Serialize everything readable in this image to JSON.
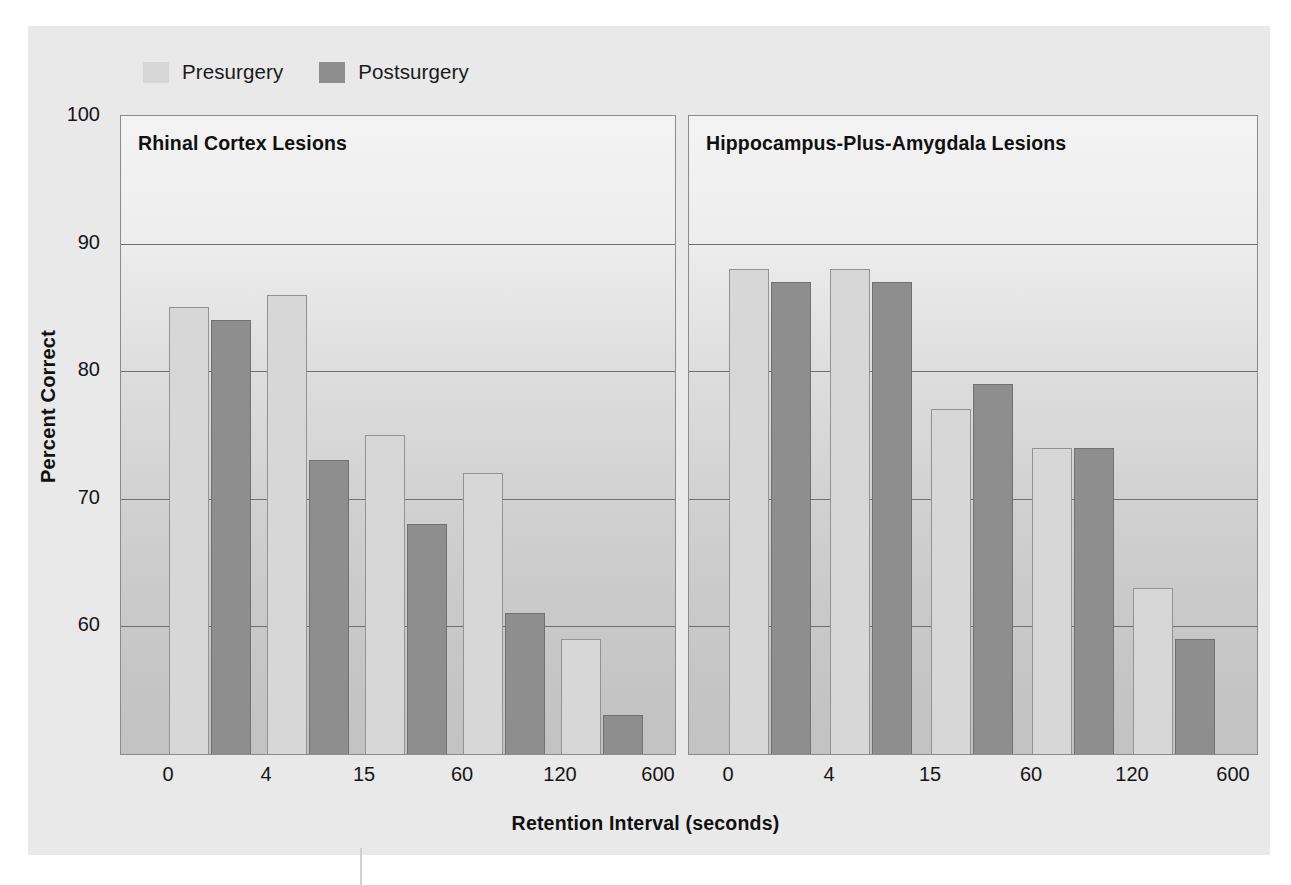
{
  "chart_data": {
    "type": "bar",
    "title": "",
    "xlabel": "Retention Interval (seconds)",
    "ylabel": "Percent Correct",
    "ylim": [
      55,
      100
    ],
    "y_ticks": [
      100,
      90,
      80,
      70,
      60
    ],
    "grid": true,
    "gridline_values": [
      90,
      80,
      70,
      60
    ],
    "legend_position": "top-left",
    "categories": [
      "0",
      "4",
      "15",
      "60",
      "120",
      "600"
    ],
    "bar_categories": [
      "4",
      "15",
      "60",
      "120",
      "600"
    ],
    "panels": [
      {
        "title": "Rhinal Cortex Lesions",
        "series": [
          {
            "name": "Presurgery",
            "values": [
              85,
              86,
              75,
              72,
              59
            ]
          },
          {
            "name": "Postsurgery",
            "values": [
              84,
              73,
              68,
              61,
              53
            ]
          }
        ]
      },
      {
        "title": "Hippocampus-Plus-Amygdala Lesions",
        "series": [
          {
            "name": "Presurgery",
            "values": [
              88,
              88,
              77,
              74,
              63
            ]
          },
          {
            "name": "Postsurgery",
            "values": [
              87,
              87,
              79,
              74,
              59
            ]
          }
        ]
      }
    ]
  },
  "legend": {
    "items": [
      {
        "label": "Presurgery",
        "color": "#d7d7d7"
      },
      {
        "label": "Postsurgery",
        "color": "#8e8e8e"
      }
    ]
  },
  "axes": {
    "y_title": "Percent Correct",
    "y_ticks": [
      "100",
      "90",
      "80",
      "70",
      "60"
    ],
    "x_title": "Retention Interval (seconds)",
    "x_ticks_left": [
      "0",
      "4",
      "15",
      "60",
      "120",
      "600"
    ],
    "x_ticks_right": [
      "0",
      "4",
      "15",
      "60",
      "120",
      "600"
    ]
  },
  "panels": {
    "left_title": "Rhinal Cortex Lesions",
    "right_title": "Hippocampus-Plus-Amygdala Lesions"
  },
  "colors": {
    "presurgery": "#d7d7d7",
    "postsurgery": "#8e8e8e",
    "plate_background": "#e9e9e9",
    "panel_border": "#8b8b8b",
    "gridline": "#6f6f6f",
    "text": "#151515"
  }
}
